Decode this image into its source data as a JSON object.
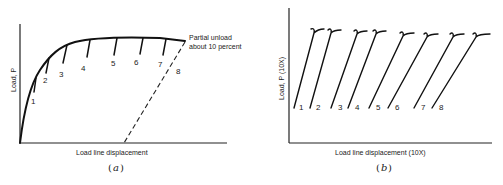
{
  "panel_a": {
    "caption": "a",
    "ylabel": "Load, P",
    "xlabel": "Load line displacement",
    "annotation": [
      "Partial unload",
      "about 10 percent"
    ],
    "unload_labels": [
      "1",
      "2",
      "3",
      "4",
      "5",
      "6",
      "7",
      "8"
    ]
  },
  "panel_b": {
    "caption": "b",
    "ylabel": "Load, P (10X)",
    "xlabel": "Load line displacement (10X)",
    "line_labels": [
      "1",
      "2",
      "3",
      "4",
      "5",
      "6",
      "7",
      "8"
    ]
  },
  "colors": {
    "ink": "#111111",
    "background": "#ffffff"
  }
}
